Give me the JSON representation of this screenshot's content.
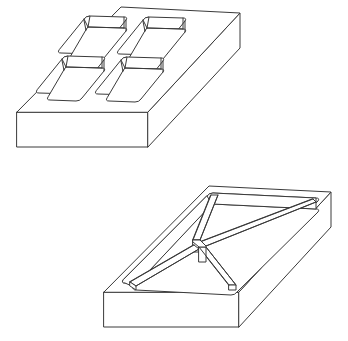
{
  "figure": {
    "background_color": "#ffffff",
    "stroke_color": "#3a3a3a",
    "stroke_width": 1,
    "canvas": {
      "width": 348,
      "height": 341
    },
    "objects": [
      {
        "id": "top-plate",
        "name": "Rectangular plate with four rounded rectangular pockets",
        "pocket_shape": "rounded-rectangle",
        "pocket_count": 4,
        "pocket_arrangement": "2 rows x 2 columns",
        "view": "isometric",
        "top_face": {
          "back_corner": [
            121,
            7
          ],
          "right_corner": [
            240,
            13
          ],
          "front_corner": [
            148,
            112
          ],
          "left_corner": [
            17,
            112
          ]
        },
        "side_faces": {
          "front_face_height": 35,
          "right_face_visible": true
        },
        "pockets": [
          {
            "index": 1,
            "row": "back",
            "column": "left"
          },
          {
            "index": 2,
            "row": "back",
            "column": "right"
          },
          {
            "index": 3,
            "row": "front",
            "column": "left"
          },
          {
            "index": 4,
            "row": "front",
            "column": "right"
          }
        ]
      },
      {
        "id": "bottom-plate",
        "name": "Rectangular plate with cross rib pattern forming four triangular pockets",
        "pocket_shape": "triangle",
        "pocket_count": 4,
        "pocket_arrangement": "X-shaped diagonal ribs from corners to center",
        "view": "isometric",
        "top_face": {
          "back_corner": [
            209,
            186
          ],
          "right_corner": [
            331,
            192
          ],
          "front_corner": [
            239,
            292
          ],
          "left_corner": [
            104,
            292
          ]
        },
        "side_faces": {
          "front_face_height": 35,
          "right_face_visible": true
        },
        "ribs": {
          "count": 4,
          "description": "Four diagonal ribs meeting at a central node, dividing the recess into four triangular pockets"
        },
        "pockets": [
          {
            "index": 1,
            "position": "back"
          },
          {
            "index": 2,
            "position": "right"
          },
          {
            "index": 3,
            "position": "front"
          },
          {
            "index": 4,
            "position": "left"
          }
        ]
      }
    ]
  }
}
